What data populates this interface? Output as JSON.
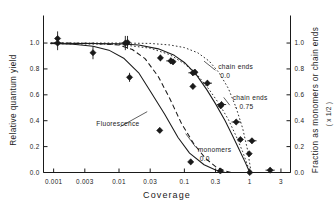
{
  "chart_data": {
    "type": "scatter",
    "title": "",
    "xlabel": "Coverage",
    "ylabel_left": "Relative quantum yield",
    "ylabel_right": "Fraction as monomers or chain ends",
    "ylabel_right_sub": "( x 1/2 )",
    "xscale": "log",
    "xlim": [
      0.0007,
      4.2
    ],
    "ylim": [
      0.0,
      1.12
    ],
    "grid": false,
    "legend_position": "inline-annotations",
    "xticks": [
      {
        "value": 0.001,
        "label": "0.001"
      },
      {
        "value": 0.003,
        "label": "0.003"
      },
      {
        "value": 0.01,
        "label": "0.01"
      },
      {
        "value": 0.03,
        "label": "0.03"
      },
      {
        "value": 0.1,
        "label": "0.1"
      },
      {
        "value": 0.3,
        "label": "0.3"
      },
      {
        "value": 1.0,
        "label": "1"
      },
      {
        "value": 3.0,
        "label": "3"
      }
    ],
    "yticks_left": [
      {
        "value": 0.0,
        "label": "0.0"
      },
      {
        "value": 0.2,
        "label": "0.2"
      },
      {
        "value": 0.4,
        "label": "0.4"
      },
      {
        "value": 0.6,
        "label": "0.6"
      },
      {
        "value": 0.8,
        "label": "0.8"
      },
      {
        "value": 1.0,
        "label": "1.0"
      }
    ],
    "yticks_right": [
      {
        "value": 0.0,
        "label": "0.0"
      },
      {
        "value": 0.2,
        "label": "0.2"
      },
      {
        "value": 0.4,
        "label": "0.4"
      },
      {
        "value": 0.6,
        "label": "0.6"
      },
      {
        "value": 0.8,
        "label": "0.8"
      },
      {
        "value": 1.0,
        "label": "1.0"
      }
    ],
    "annotations": [
      {
        "id": "chain-ends-00",
        "text": "chain ends",
        "value": "0.0",
        "x": 0.33,
        "y": 0.8
      },
      {
        "id": "chain-ends-075",
        "text": "chain ends",
        "value": "- 0.75",
        "x": 0.55,
        "y": 0.56
      },
      {
        "id": "monomers-00",
        "text": "monomers",
        "value": "0.0",
        "x": 0.16,
        "y": 0.155
      },
      {
        "id": "fluorescence",
        "text": "Fluorescence",
        "value": "",
        "x": 0.0045,
        "y": 0.36
      }
    ],
    "series": [
      {
        "name": "Fluorescence",
        "style": "solid-left",
        "points": [
          {
            "x": 0.0009,
            "y": 0.997
          },
          {
            "x": 0.002,
            "y": 0.99
          },
          {
            "x": 0.004,
            "y": 0.975
          },
          {
            "x": 0.007,
            "y": 0.945
          },
          {
            "x": 0.012,
            "y": 0.88
          },
          {
            "x": 0.02,
            "y": 0.77
          },
          {
            "x": 0.03,
            "y": 0.63
          },
          {
            "x": 0.05,
            "y": 0.45
          },
          {
            "x": 0.08,
            "y": 0.27
          },
          {
            "x": 0.12,
            "y": 0.15
          },
          {
            "x": 0.2,
            "y": 0.06
          },
          {
            "x": 0.3,
            "y": 0.02
          },
          {
            "x": 0.42,
            "y": 0.0
          }
        ]
      },
      {
        "name": "monomers 0.0",
        "style": "dashed",
        "points": [
          {
            "x": 0.0009,
            "y": 1.0
          },
          {
            "x": 0.004,
            "y": 0.998
          },
          {
            "x": 0.01,
            "y": 0.985
          },
          {
            "x": 0.016,
            "y": 0.95
          },
          {
            "x": 0.025,
            "y": 0.88
          },
          {
            "x": 0.04,
            "y": 0.74
          },
          {
            "x": 0.06,
            "y": 0.57
          },
          {
            "x": 0.09,
            "y": 0.38
          },
          {
            "x": 0.14,
            "y": 0.22
          },
          {
            "x": 0.21,
            "y": 0.11
          },
          {
            "x": 0.3,
            "y": 0.045
          },
          {
            "x": 0.42,
            "y": 0.012
          },
          {
            "x": 0.52,
            "y": 0.0
          }
        ]
      },
      {
        "name": "chain ends - 0.75",
        "style": "solid-right",
        "points": [
          {
            "x": 0.0009,
            "y": 0.998
          },
          {
            "x": 0.01,
            "y": 0.995
          },
          {
            "x": 0.02,
            "y": 0.985
          },
          {
            "x": 0.04,
            "y": 0.955
          },
          {
            "x": 0.07,
            "y": 0.905
          },
          {
            "x": 0.1,
            "y": 0.85
          },
          {
            "x": 0.15,
            "y": 0.76
          },
          {
            "x": 0.22,
            "y": 0.64
          },
          {
            "x": 0.3,
            "y": 0.53
          },
          {
            "x": 0.42,
            "y": 0.4
          },
          {
            "x": 0.55,
            "y": 0.28
          },
          {
            "x": 0.7,
            "y": 0.17
          },
          {
            "x": 0.85,
            "y": 0.08
          },
          {
            "x": 1.0,
            "y": 0.0
          }
        ]
      },
      {
        "name": "chain ends 0.0",
        "style": "dotted-upper",
        "points": [
          {
            "x": 0.0009,
            "y": 1.0
          },
          {
            "x": 0.01,
            "y": 1.0
          },
          {
            "x": 0.03,
            "y": 0.997
          },
          {
            "x": 0.06,
            "y": 0.985
          },
          {
            "x": 0.1,
            "y": 0.965
          },
          {
            "x": 0.16,
            "y": 0.925
          },
          {
            "x": 0.24,
            "y": 0.86
          },
          {
            "x": 0.34,
            "y": 0.77
          },
          {
            "x": 0.47,
            "y": 0.65
          },
          {
            "x": 0.62,
            "y": 0.5
          },
          {
            "x": 0.78,
            "y": 0.34
          },
          {
            "x": 0.92,
            "y": 0.18
          },
          {
            "x": 1.05,
            "y": 0.0
          }
        ]
      },
      {
        "name": "dotted lower",
        "style": "dotted-lower",
        "points": [
          {
            "x": 0.0009,
            "y": 0.995
          },
          {
            "x": 0.01,
            "y": 0.99
          },
          {
            "x": 0.03,
            "y": 0.96
          },
          {
            "x": 0.06,
            "y": 0.91
          },
          {
            "x": 0.1,
            "y": 0.84
          },
          {
            "x": 0.16,
            "y": 0.75
          },
          {
            "x": 0.24,
            "y": 0.64
          },
          {
            "x": 0.34,
            "y": 0.53
          },
          {
            "x": 0.47,
            "y": 0.41
          },
          {
            "x": 0.62,
            "y": 0.28
          },
          {
            "x": 0.78,
            "y": 0.16
          },
          {
            "x": 0.92,
            "y": 0.06
          },
          {
            "x": 1.0,
            "y": 0.0
          }
        ]
      }
    ],
    "data_points_filled": [
      {
        "x": 0.00115,
        "y": 1.035,
        "yerr": 0.055
      },
      {
        "x": 0.00115,
        "y": 1.0,
        "yerr": 0.055
      },
      {
        "x": 0.004,
        "y": 0.925,
        "yerr": 0.05
      },
      {
        "x": 0.0135,
        "y": 1.005,
        "yerr": 0.05
      },
      {
        "x": 0.0145,
        "y": 0.735,
        "yerr": 0.035
      },
      {
        "x": 0.042,
        "y": 0.325,
        "yerr": 0.02
      },
      {
        "x": 0.043,
        "y": 0.885,
        "yerr": 0.025
      },
      {
        "x": 0.067,
        "y": 0.855,
        "yerr": 0.02
      },
      {
        "x": 0.125,
        "y": 0.082,
        "yerr": 0.018
      },
      {
        "x": 0.135,
        "y": 0.665,
        "yerr": 0.022
      },
      {
        "x": 0.145,
        "y": 0.775,
        "yerr": 0.022
      },
      {
        "x": 0.355,
        "y": 0.012,
        "yerr": 0.015
      },
      {
        "x": 0.36,
        "y": 0.515,
        "yerr": 0.022
      },
      {
        "x": 0.72,
        "y": 0.255,
        "yerr": 0.02
      },
      {
        "x": 0.98,
        "y": 0.145,
        "yerr": 0.02
      },
      {
        "x": 1.0,
        "y": 0.0,
        "yerr": 0.012
      }
    ],
    "data_points_open": [
      {
        "x": 0.0125,
        "y": 1.0,
        "yerr": 0.055
      },
      {
        "x": 0.062,
        "y": 0.862,
        "yerr": 0.025
      },
      {
        "x": 0.135,
        "y": 0.77,
        "yerr": 0.022
      },
      {
        "x": 0.225,
        "y": 0.69,
        "yerr": 0.022
      },
      {
        "x": 0.37,
        "y": 0.525,
        "yerr": 0.022
      },
      {
        "x": 0.62,
        "y": 0.39,
        "yerr": 0.02
      },
      {
        "x": 1.08,
        "y": 0.245,
        "yerr": 0.02
      },
      {
        "x": 2.05,
        "y": 0.018,
        "yerr": 0.015
      }
    ]
  }
}
